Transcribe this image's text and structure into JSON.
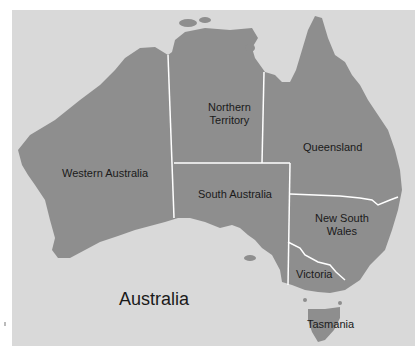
{
  "map": {
    "title": "Australia",
    "colors": {
      "water": "#d9d9d9",
      "land": "#8e8e8e",
      "border": "#ffffff",
      "text": "#1a1a1a"
    },
    "regions": [
      {
        "name": "Western Australia"
      },
      {
        "name": "Northern Territory",
        "line1": "Northern",
        "line2": "Territory"
      },
      {
        "name": "Queensland"
      },
      {
        "name": "South Australia"
      },
      {
        "name": "New South Wales",
        "line1": "New South",
        "line2": "Wales"
      },
      {
        "name": "Victoria"
      },
      {
        "name": "Tasmania"
      }
    ]
  }
}
